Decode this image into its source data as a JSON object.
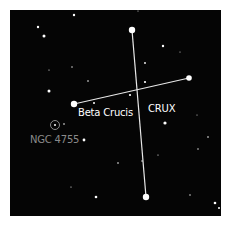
{
  "title": "CRUX",
  "colors": {
    "background": "#ffffff",
    "sky": "#050505",
    "star": "#ffffff",
    "line": "#e8e8e8",
    "label_primary": "#ffffff",
    "label_dim": "#8a8a8a"
  },
  "labels": {
    "constellation": "CRUX",
    "beta_crucis": "Beta Crucis",
    "cluster": "NGC 4755"
  },
  "constellation_lines": [
    {
      "name": "vertical-line",
      "from": [
        132,
        30
      ],
      "to": [
        146,
        197
      ]
    },
    {
      "name": "horizontal-line",
      "from": [
        74,
        104
      ],
      "to": [
        189,
        78
      ]
    }
  ],
  "major_stars": [
    {
      "name": "top-star",
      "x": 132,
      "y": 30,
      "r": 3.2
    },
    {
      "name": "bottom-star",
      "x": 146,
      "y": 197,
      "r": 3.2
    },
    {
      "name": "right-star",
      "x": 189,
      "y": 78,
      "r": 2.8
    },
    {
      "name": "beta-crucis-star",
      "x": 74,
      "y": 104,
      "r": 3.2
    }
  ],
  "minor_stars": [
    {
      "x": 74,
      "y": 15,
      "r": 1.2
    },
    {
      "x": 38,
      "y": 27,
      "r": 1.2
    },
    {
      "x": 44,
      "y": 36,
      "r": 1.5
    },
    {
      "x": 49,
      "y": 91,
      "r": 1.5
    },
    {
      "x": 163,
      "y": 46,
      "r": 1.2
    },
    {
      "x": 145,
      "y": 63,
      "r": 0.9
    },
    {
      "x": 145,
      "y": 82,
      "r": 1.1
    },
    {
      "x": 130,
      "y": 95,
      "r": 1.1
    },
    {
      "x": 94,
      "y": 103,
      "r": 1.0
    },
    {
      "x": 88,
      "y": 81,
      "r": 0.8
    },
    {
      "x": 72,
      "y": 67,
      "r": 0.7
    },
    {
      "x": 49,
      "y": 70,
      "r": 0.6
    },
    {
      "x": 165,
      "y": 123,
      "r": 1.6
    },
    {
      "x": 84,
      "y": 140,
      "r": 1.4
    },
    {
      "x": 64,
      "y": 124,
      "r": 0.8
    },
    {
      "x": 96,
      "y": 197,
      "r": 1.3
    },
    {
      "x": 118,
      "y": 163,
      "r": 0.8
    },
    {
      "x": 158,
      "y": 155,
      "r": 0.6
    },
    {
      "x": 142,
      "y": 161,
      "r": 0.7
    },
    {
      "x": 208,
      "y": 137,
      "r": 0.8
    },
    {
      "x": 198,
      "y": 149,
      "r": 0.7
    },
    {
      "x": 215,
      "y": 203,
      "r": 1.3
    },
    {
      "x": 219,
      "y": 208,
      "r": 1.0
    },
    {
      "x": 190,
      "y": 195,
      "r": 0.7
    },
    {
      "x": 71,
      "y": 187,
      "r": 0.6
    },
    {
      "x": 197,
      "y": 115,
      "r": 0.5
    },
    {
      "x": 180,
      "y": 52,
      "r": 0.5
    },
    {
      "x": 138,
      "y": 11,
      "r": 0.5
    }
  ],
  "cluster_marker": {
    "x": 55,
    "y": 125,
    "r": 4.5
  }
}
